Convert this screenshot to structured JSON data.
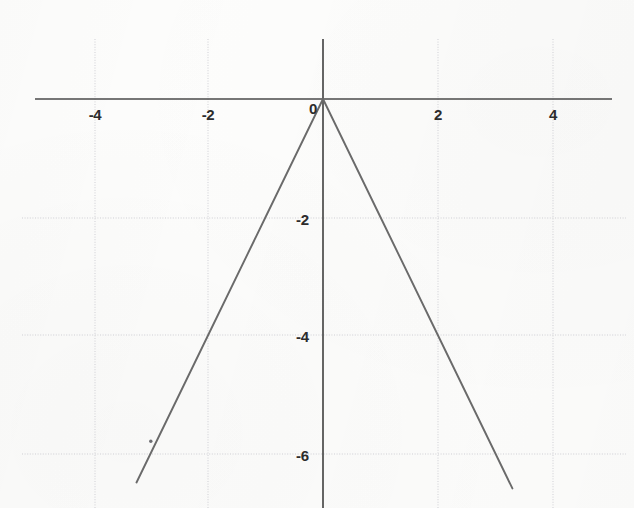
{
  "chart_data": {
    "type": "line",
    "title": "",
    "subtitle": "",
    "xlabel": "",
    "ylabel": "",
    "xlim": [
      -5.05,
      5.05
    ],
    "ylim": [
      -6.6,
      1.0
    ],
    "grid": true,
    "grid_spacing": 2,
    "legend": "none",
    "function": "y = -2|x|",
    "x_tick_labels": [
      "-4",
      "-2",
      "0",
      "2",
      "4"
    ],
    "x_tick_values": [
      -4,
      -2,
      0,
      2,
      4
    ],
    "y_tick_labels": [
      "-2",
      "-4",
      "-6"
    ],
    "y_tick_values": [
      -2,
      -4,
      -6
    ],
    "origin_label": "0",
    "series": [
      {
        "name": "y = -2|x|",
        "x": [
          -3.25,
          -2,
          -1,
          0,
          1,
          2,
          3.3
        ],
        "values": [
          -6.5,
          -4,
          -2,
          0,
          -2,
          -4,
          -6.6
        ]
      }
    ],
    "annotations": [
      {
        "name": "scan-speck",
        "x": -3.0,
        "y": -5.8
      }
    ],
    "colors": {
      "curve": "#6a6a6a",
      "axis": "#4a4a4a",
      "grid": "#c9c9cf",
      "background": "#fdfdfc",
      "tick_text": "#2c2c2c"
    }
  },
  "ticks": {
    "x": {
      "m4": "-4",
      "m2": "-2",
      "zero": "0",
      "p2": "2",
      "p4": "4"
    },
    "y": {
      "m2": "-2",
      "m4": "-4",
      "m6": "-6"
    }
  }
}
